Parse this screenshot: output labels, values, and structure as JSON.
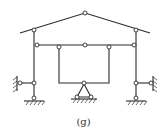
{
  "diagram": {
    "caption": "(g)",
    "colors": {
      "line": "#2a2a2a",
      "background": "#ffffff"
    }
  }
}
